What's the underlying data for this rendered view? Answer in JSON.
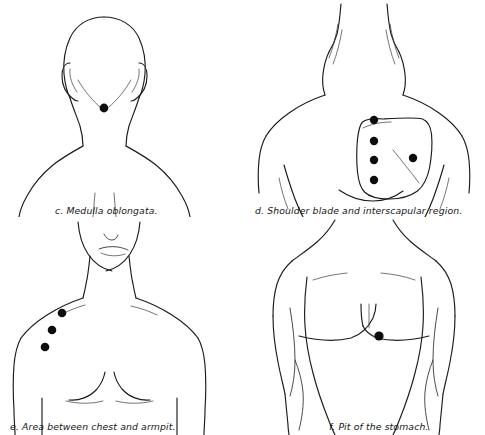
{
  "sheet": {
    "title": "Vital points of the body — plates c through f",
    "background_color": "#ffffff",
    "ink_color": "#1b1b1b",
    "dot_color": "#0d0d0d",
    "layout": "2x2 grid of anatomical line drawings"
  },
  "panels": [
    {
      "id": "c",
      "letter": "c.",
      "caption": "Medulla oblongata.",
      "full_caption": "c.  Medulla oblongata.",
      "view": "posterior view of head, neck and shoulders",
      "body_region": "back of head and upper back",
      "dot_count": 1,
      "dots": [
        {
          "label": "medulla oblongata point",
          "x": 104,
          "y": 108
        }
      ]
    },
    {
      "id": "d",
      "letter": "d.",
      "caption": "Shoulder blade and interscapular region.",
      "full_caption": "d.  Shoulder blade and interscapular region.",
      "view": "posterior view of upper back and shoulders",
      "body_region": "scapula and interscapular spine",
      "dot_count": 5,
      "outlined_region": "left shoulder blade (scapula) outline",
      "dots": [
        {
          "label": "interscapular point 1",
          "x": 374,
          "y": 120
        },
        {
          "label": "interscapular point 2",
          "x": 374,
          "y": 141
        },
        {
          "label": "interscapular point 3",
          "x": 374,
          "y": 160
        },
        {
          "label": "interscapular point 4",
          "x": 374,
          "y": 180
        },
        {
          "label": "shoulder blade point",
          "x": 413,
          "y": 158
        }
      ]
    },
    {
      "id": "e",
      "letter": "e.",
      "caption": "Area between chest and armpit.",
      "full_caption": "e.  Area between chest and armpit.",
      "view": "anterior view of female chest, neck and lower face",
      "body_region": "chest and axilla",
      "dot_count": 3,
      "dots": [
        {
          "label": "chest-armpit point 1",
          "x": 62,
          "y": 313
        },
        {
          "label": "chest-armpit point 2",
          "x": 52,
          "y": 330
        },
        {
          "label": "chest-armpit point 3",
          "x": 45,
          "y": 347
        }
      ]
    },
    {
      "id": "f",
      "letter": "f.",
      "caption": "Pit of the stomach.",
      "full_caption": "f. Pit of the stomach.",
      "view": "anterior view of male chest and abdomen",
      "body_region": "solar plexus / epigastrium",
      "dot_count": 1,
      "dots": [
        {
          "label": "pit of the stomach point",
          "x": 379,
          "y": 336
        }
      ]
    }
  ]
}
